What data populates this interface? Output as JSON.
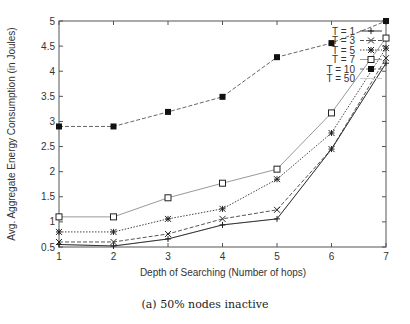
{
  "chart_data": {
    "type": "line",
    "title": "",
    "caption": "(a) 50% nodes inactive",
    "xlabel": "Depth of Searching (Number of hops)",
    "ylabel": "Avg. Aggregate Energy Consumption (in Joules)",
    "x": [
      1,
      2,
      3,
      4,
      5,
      6,
      7
    ],
    "xlim": [
      1,
      7
    ],
    "ylim": [
      0.5,
      5
    ],
    "xticks": [
      1,
      2,
      3,
      4,
      5,
      6,
      7
    ],
    "yticks": [
      0.5,
      1,
      1.5,
      2,
      2.5,
      3,
      3.5,
      4,
      4.5,
      5
    ],
    "grid": false,
    "legend_position": "top-right",
    "series": [
      {
        "name": "T = 1",
        "marker": "plus",
        "dash": "solid",
        "color": "#333333",
        "values": [
          0.55,
          0.52,
          0.66,
          0.94,
          1.06,
          2.45,
          4.16
        ]
      },
      {
        "name": "T = 3",
        "marker": "cross",
        "dash": "dashed",
        "color": "#555555",
        "values": [
          0.6,
          0.6,
          0.76,
          1.06,
          1.24,
          2.45,
          4.26
        ]
      },
      {
        "name": "T = 5",
        "marker": "star",
        "dash": "dotted",
        "color": "#444444",
        "values": [
          0.8,
          0.8,
          1.06,
          1.26,
          1.85,
          2.77,
          4.46
        ]
      },
      {
        "name": "T = 7",
        "marker": "square-open",
        "dash": "solid",
        "color": "#999999",
        "values": [
          1.1,
          1.1,
          1.48,
          1.77,
          2.05,
          3.17,
          4.66
        ]
      },
      {
        "name": "T = 10",
        "marker": "square-filled",
        "dash": "dashed",
        "color": "#666666",
        "values": [
          2.9,
          2.9,
          3.19,
          3.49,
          4.28,
          4.56,
          5.0
        ]
      },
      {
        "name": "T = 50",
        "marker": "none",
        "dash": "solid",
        "color": "#cccccc",
        "values": [
          0.55,
          0.52,
          0.66,
          0.94,
          1.06,
          2.45,
          4.16
        ]
      }
    ]
  },
  "figure": {
    "caption": "(a) 50% nodes inactive",
    "xlabel": "Depth of Searching (Number of hops)",
    "ylabel": "Avg. Aggregate Energy Consumption (in Joules)"
  }
}
